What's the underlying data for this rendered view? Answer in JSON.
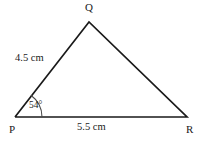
{
  "figure": {
    "kind": "geometry-triangle-diagram",
    "background_color": "#ffffff",
    "stroke_color": "#1a1a1a",
    "stroke_width": 1.6,
    "vertices": [
      {
        "name": "P",
        "label": "P",
        "x": 15,
        "y": 117
      },
      {
        "name": "Q",
        "label": "Q",
        "x": 89,
        "y": 22
      },
      {
        "name": "R",
        "label": "R",
        "x": 187,
        "y": 117
      }
    ],
    "sides": [
      {
        "name": "PQ",
        "from": "P",
        "to": "Q",
        "label": "4.5 cm"
      },
      {
        "name": "QR",
        "from": "Q",
        "to": "R",
        "label": ""
      },
      {
        "name": "PR",
        "from": "P",
        "to": "R",
        "label": "5.5 cm"
      }
    ],
    "angles": [
      {
        "at": "P",
        "label": "54°",
        "arc_radius": 27
      }
    ]
  }
}
